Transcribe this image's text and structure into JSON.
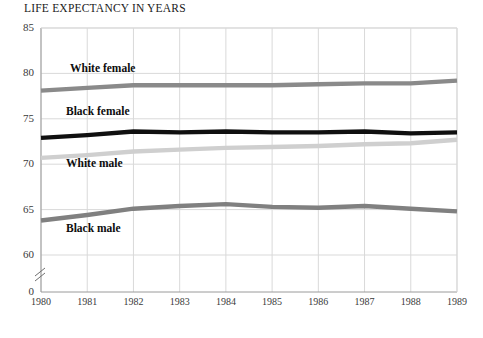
{
  "chart": {
    "title": "LIFE EXPECTANCY IN YEARS"
  },
  "axes": {
    "y_ticks": [
      "85",
      "80",
      "75",
      "70",
      "65",
      "60",
      "0"
    ],
    "x_ticks": [
      "1980",
      "1981",
      "1982",
      "1983",
      "1984",
      "1985",
      "1986",
      "1987",
      "1988",
      "1989"
    ],
    "axis_break_name": "y-axis-break"
  },
  "series_labels": {
    "white_female": "White female",
    "black_female": "Black female",
    "white_male": "White male",
    "black_male": "Black male"
  },
  "colors": {
    "white_female": "#8a8a8a",
    "black_female": "#101010",
    "white_male": "#cfcfcf",
    "black_male": "#808080",
    "grid": "#d9d9d9",
    "axis": "#9a9a9a",
    "text": "#1a1a1a"
  },
  "chart_data": {
    "type": "line",
    "title": "LIFE EXPECTANCY IN YEARS",
    "xlabel": "",
    "ylabel": "LIFE EXPECTANCY IN YEARS",
    "x": [
      1980,
      1981,
      1982,
      1983,
      1984,
      1985,
      1986,
      1987,
      1988,
      1989
    ],
    "categories": [
      "1980",
      "1981",
      "1982",
      "1983",
      "1984",
      "1985",
      "1986",
      "1987",
      "1988",
      "1989"
    ],
    "ylim": [
      60,
      85
    ],
    "yticks": [
      60,
      65,
      70,
      75,
      80,
      85
    ],
    "axis_break": "between 0 and 60",
    "grid": true,
    "legend": "inline labels on plot",
    "series": [
      {
        "name": "White female",
        "color": "#8a8a8a",
        "values": [
          78.1,
          78.4,
          78.7,
          78.7,
          78.7,
          78.7,
          78.8,
          78.9,
          78.9,
          79.2
        ]
      },
      {
        "name": "Black female",
        "color": "#101010",
        "values": [
          72.9,
          73.2,
          73.6,
          73.5,
          73.6,
          73.5,
          73.5,
          73.6,
          73.4,
          73.5
        ]
      },
      {
        "name": "White male",
        "color": "#cfcfcf",
        "values": [
          70.7,
          71.0,
          71.4,
          71.6,
          71.8,
          71.9,
          72.0,
          72.2,
          72.3,
          72.7
        ]
      },
      {
        "name": "Black male",
        "color": "#808080",
        "values": [
          63.8,
          64.4,
          65.1,
          65.4,
          65.6,
          65.3,
          65.2,
          65.4,
          65.1,
          64.8
        ]
      }
    ]
  }
}
